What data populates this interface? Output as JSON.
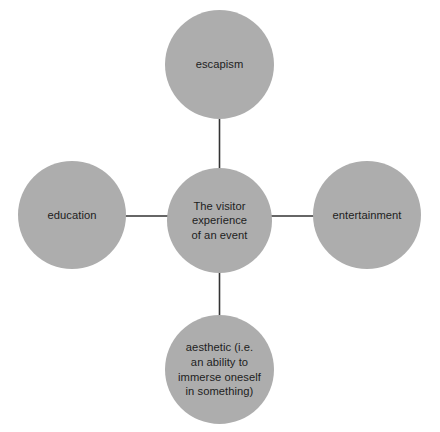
{
  "diagram": {
    "type": "hub-and-spoke",
    "background_color": "#ffffff",
    "node_fill_color": "#adadad",
    "connector_color": "#333333",
    "text_color": "#1d1d1d",
    "center": {
      "id": "center",
      "label": "The visitor\nexperience\nof an event"
    },
    "spokes": [
      {
        "id": "escapism",
        "label": "escapism",
        "position": "top"
      },
      {
        "id": "entertainment",
        "label": "entertainment",
        "position": "right"
      },
      {
        "id": "aesthetic",
        "label": "aesthetic (i.e.\nan ability to\nimmerse oneself\nin something)",
        "position": "bottom"
      },
      {
        "id": "education",
        "label": "education",
        "position": "left"
      }
    ],
    "connectors": [
      {
        "id": "connector-center-escapism",
        "from": "center",
        "to": "escapism"
      },
      {
        "id": "connector-center-entertainment",
        "from": "center",
        "to": "entertainment"
      },
      {
        "id": "connector-center-aesthetic",
        "from": "center",
        "to": "aesthetic"
      },
      {
        "id": "connector-center-education",
        "from": "center",
        "to": "education"
      }
    ]
  }
}
